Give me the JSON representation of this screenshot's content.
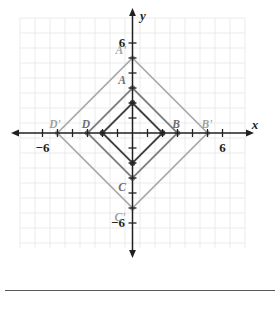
{
  "figure": {
    "type": "coordinate-plane-dilation-diagram",
    "axes": {
      "x_label": "x",
      "y_label": "y",
      "x_ticks_labeled": [
        {
          "value": -6,
          "text": "−6"
        },
        {
          "value": 6,
          "text": "6"
        }
      ],
      "y_ticks_labeled": [
        {
          "value": 6,
          "text": "6"
        },
        {
          "value": -6,
          "text": "−6"
        }
      ],
      "x_range": [
        -7.5,
        7.5
      ],
      "y_range": [
        -7.5,
        7.5
      ],
      "grid": true,
      "grid_step": 1
    },
    "shapes": [
      {
        "name": "outer-quadrilateral",
        "color": "#a7a9ac",
        "vertices": [
          {
            "label": "A'",
            "x": 0,
            "y": 5
          },
          {
            "label": "B'",
            "x": 5,
            "y": 0
          },
          {
            "label": "C'",
            "x": 0,
            "y": -5
          },
          {
            "label": "D'",
            "x": -5,
            "y": 0
          }
        ]
      },
      {
        "name": "middle-quadrilateral",
        "color": "#808285",
        "vertices": [
          {
            "label": "A",
            "x": 0,
            "y": 3
          },
          {
            "label": "B",
            "x": 3,
            "y": 0
          },
          {
            "label": "C",
            "x": 0,
            "y": -3
          },
          {
            "label": "D",
            "x": -3,
            "y": 0
          }
        ]
      },
      {
        "name": "inner-quadrilateral",
        "color": "#414042",
        "vertices": [
          {
            "label": "",
            "x": 0,
            "y": 2
          },
          {
            "label": "",
            "x": 2,
            "y": 0
          },
          {
            "label": "",
            "x": 0,
            "y": -2
          },
          {
            "label": "",
            "x": -2,
            "y": 0
          }
        ]
      }
    ],
    "point_labels": [
      {
        "text": "A'",
        "x": 0,
        "y": 5,
        "placement": "left-above",
        "style": "outer"
      },
      {
        "text": "B'",
        "x": 5,
        "y": 0,
        "placement": "right-above",
        "style": "outer"
      },
      {
        "text": "C'",
        "x": 0,
        "y": -5,
        "placement": "left-below",
        "style": "outer"
      },
      {
        "text": "D'",
        "x": -5,
        "y": 0,
        "placement": "left-above",
        "style": "outer"
      },
      {
        "text": "A",
        "x": 0,
        "y": 3,
        "placement": "left-above",
        "style": "mid"
      },
      {
        "text": "B",
        "x": 3,
        "y": 0,
        "placement": "left-above",
        "style": "mid"
      },
      {
        "text": "C",
        "x": 0,
        "y": -3,
        "placement": "left-below",
        "style": "mid"
      },
      {
        "text": "D",
        "x": -3,
        "y": 0,
        "placement": "left-above",
        "style": "mid"
      }
    ],
    "colors": {
      "grid": "#e6e7e8",
      "axis": "#231f20",
      "outer_shape": "#a7a9ac",
      "middle_shape": "#808285",
      "inner_shape": "#414042",
      "rule": "#58595b",
      "background": "#ffffff"
    },
    "footer_rule": true
  }
}
